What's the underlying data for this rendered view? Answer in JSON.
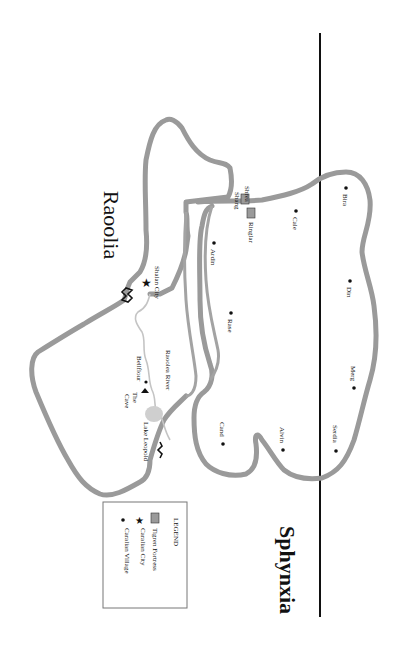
{
  "map": {
    "regions": [
      {
        "name": "Raoolia"
      },
      {
        "name": "Sphynxia"
      }
    ],
    "features": {
      "river": "Raoolea River",
      "lake": "Lake Leopold",
      "cave": "The Cave"
    },
    "places": {
      "shrea_shang": "Shrea Shang",
      "ringlar": "Ringlar",
      "shalan_city": "Shalan City",
      "bellflour": "Bellflour",
      "cale": "Cale",
      "ardin": "Ardin",
      "rase": "Rase",
      "cand": "Cand",
      "alvin": "Alvin",
      "bira": "Bira",
      "din": "Din",
      "merg": "Merg",
      "serdia": "Serdia"
    },
    "legend": {
      "title": "LEGEND",
      "items": [
        {
          "symbol": "fortress-icon",
          "label": "Tigren Fortress"
        },
        {
          "symbol": "star-icon",
          "label": "Caralian City"
        },
        {
          "symbol": "dot-icon",
          "label": "Caralian Village"
        }
      ]
    },
    "colors": {
      "coast": "#9a9a9a",
      "river": "#c4c4c4",
      "lake": "#cfcfcf",
      "border": "#111111"
    }
  }
}
